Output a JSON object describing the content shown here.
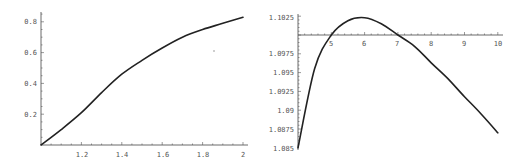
{
  "chart_data": [
    {
      "type": "line",
      "title": "",
      "xlabel": "",
      "ylabel": "",
      "xlim": [
        1,
        2
      ],
      "ylim": [
        0,
        0.85
      ],
      "x_ticks": [
        "1.2",
        "1.4",
        "1.6",
        "1.8",
        "2"
      ],
      "y_ticks": [
        "0.2",
        "0.4",
        "0.6",
        "0.8"
      ],
      "grid": false,
      "legend": null,
      "x": [
        1.0,
        1.1,
        1.2,
        1.3,
        1.4,
        1.5,
        1.6,
        1.7,
        1.8,
        1.9,
        2.0
      ],
      "series": [
        {
          "name": "",
          "values": [
            0.0,
            0.1,
            0.21,
            0.34,
            0.46,
            0.55,
            0.63,
            0.7,
            0.75,
            0.79,
            0.83
          ]
        }
      ]
    },
    {
      "type": "line",
      "title": "",
      "xlabel": "",
      "ylabel": "",
      "xlim": [
        4,
        10
      ],
      "ylim": [
        1.085,
        1.1025
      ],
      "x_axis_crosses_at": 1.1,
      "x_ticks": [
        "5",
        "6",
        "7",
        "8",
        "9",
        "10"
      ],
      "y_ticks": [
        "1.085",
        "1.0875",
        "1.09",
        "1.0925",
        "1.095",
        "1.0975",
        "1.1025"
      ],
      "grid": false,
      "legend": null,
      "x": [
        4.0,
        4.5,
        5.0,
        5.5,
        6.0,
        6.5,
        7.0,
        7.5,
        8.0,
        8.5,
        9.0,
        9.5,
        10.0
      ],
      "series": [
        {
          "name": "",
          "values": [
            1.085,
            1.0955,
            1.1,
            1.1019,
            1.1023,
            1.1015,
            1.1,
            1.0985,
            1.0963,
            1.0942,
            1.0918,
            1.0895,
            1.087
          ]
        }
      ]
    }
  ],
  "left_chart": {
    "x_tick_labels": [
      "1.2",
      "1.4",
      "1.6",
      "1.8",
      "2"
    ],
    "y_tick_labels": [
      "0.2",
      "0.4",
      "0.6",
      "0.8"
    ]
  },
  "right_chart": {
    "x_tick_labels": [
      "5",
      "6",
      "7",
      "8",
      "9",
      "10"
    ],
    "y_tick_labels": [
      "1.1025",
      "1.0975",
      "1.095",
      "1.0925",
      "1.09",
      "1.0875",
      "1.085"
    ]
  }
}
